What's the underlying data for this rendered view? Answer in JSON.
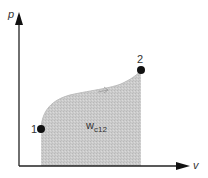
{
  "diagram": {
    "axes": {
      "y_label": "p",
      "x_label": "v"
    },
    "points": [
      {
        "id": "point-1",
        "label": "1",
        "x": 41,
        "y": 129
      },
      {
        "id": "point-2",
        "label": "2",
        "x": 141,
        "y": 70
      }
    ],
    "area_label": {
      "main": "w",
      "subscript": "c12"
    },
    "colors": {
      "axis": "#222222",
      "fill": "#c8c8c8",
      "point": "#111111",
      "text": "#333333"
    }
  }
}
